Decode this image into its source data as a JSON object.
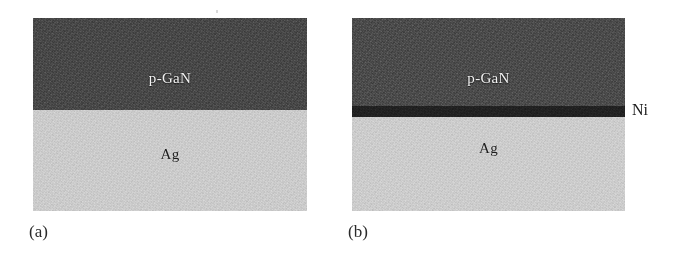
{
  "figure": {
    "background_color": "#ffffff",
    "panels": [
      {
        "id": "panel-a",
        "caption": "(a)",
        "geometry": {
          "left": 33,
          "top": 18,
          "width": 274,
          "height": 193
        },
        "caption_position": {
          "left": 29,
          "top": 222
        },
        "layers": [
          {
            "name": "p-GaN",
            "label": "p-GaN",
            "label_style": "light",
            "color": "#4a4a4a",
            "top": 0,
            "height": 92,
            "label_top": 52
          },
          {
            "name": "Ag",
            "label": "Ag",
            "label_style": "dark",
            "color": "#cdcdcd",
            "top": 92,
            "height": 101,
            "label_top": 128
          }
        ],
        "annotations": []
      },
      {
        "id": "panel-b",
        "caption": "(b)",
        "geometry": {
          "left": 352,
          "top": 18,
          "width": 273,
          "height": 193
        },
        "caption_position": {
          "left": 348,
          "top": 222
        },
        "layers": [
          {
            "name": "p-GaN",
            "label": "p-GaN",
            "label_style": "light",
            "color": "#4d4d4d",
            "top": 0,
            "height": 88,
            "label_top": 52
          },
          {
            "name": "Ni",
            "label": "",
            "label_style": "dark",
            "color": "#222222",
            "top": 88,
            "height": 11,
            "label_top": 0
          },
          {
            "name": "Ag",
            "label": "Ag",
            "label_style": "dark",
            "color": "#cecece",
            "top": 99,
            "height": 94,
            "label_top": 122
          }
        ],
        "annotations": [
          {
            "name": "ni-side-label",
            "text": "Ni",
            "left": 632,
            "top": 101
          }
        ]
      }
    ]
  }
}
